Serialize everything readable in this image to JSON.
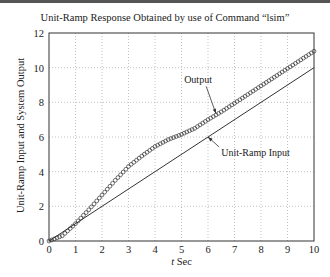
{
  "chart_data": {
    "type": "line",
    "title": "Unit-Ramp Response Obtained by use of Command “lsim”",
    "xlabel_italic": "t",
    "xlabel_rest": " Sec",
    "ylabel": "Unit-Ramp Input and System Output",
    "xlim": [
      0,
      10
    ],
    "ylim": [
      0,
      12
    ],
    "xticks": [
      0,
      1,
      2,
      3,
      4,
      5,
      6,
      7,
      8,
      9,
      10
    ],
    "yticks": [
      0,
      2,
      4,
      6,
      8,
      10,
      12
    ],
    "grid": true,
    "series": [
      {
        "name": "Output",
        "style": "circles",
        "x": [
          0,
          0.5,
          1,
          1.5,
          2,
          2.5,
          3,
          3.5,
          4,
          4.5,
          5,
          5.5,
          6,
          6.5,
          7,
          7.5,
          8,
          8.5,
          9,
          9.5,
          10
        ],
        "values": [
          0,
          0.3,
          1.0,
          1.8,
          2.65,
          3.5,
          4.3,
          4.9,
          5.45,
          5.85,
          6.15,
          6.5,
          7.0,
          7.45,
          7.95,
          8.45,
          8.95,
          9.45,
          9.95,
          10.45,
          10.95
        ]
      },
      {
        "name": "Unit-Ramp Input",
        "style": "line",
        "x": [
          0,
          10
        ],
        "values": [
          0,
          10
        ]
      }
    ],
    "annotations": [
      {
        "text": "Output",
        "x": 5.1,
        "y": 9.1,
        "arrow_to": [
          6.3,
          7.35
        ]
      },
      {
        "text": "Unit-Ramp Input",
        "x": 6.5,
        "y": 4.9,
        "arrow_to": [
          6.0,
          6.0
        ]
      }
    ]
  }
}
